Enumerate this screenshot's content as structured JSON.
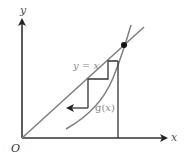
{
  "diagram": {
    "type": "cobweb-fixed-point-iteration",
    "axes": {
      "x_label": "x",
      "y_label": "y",
      "origin_label": "O"
    },
    "curves": {
      "line_label": "y = x",
      "curve_label_prefix": "g(",
      "curve_label_var": "x",
      "curve_label_suffix": ")"
    },
    "colors": {
      "axis": "#333333",
      "line": "#808080",
      "curve": "#808080",
      "cobweb": "#333333",
      "point": "#111111",
      "label": "#888888"
    }
  }
}
